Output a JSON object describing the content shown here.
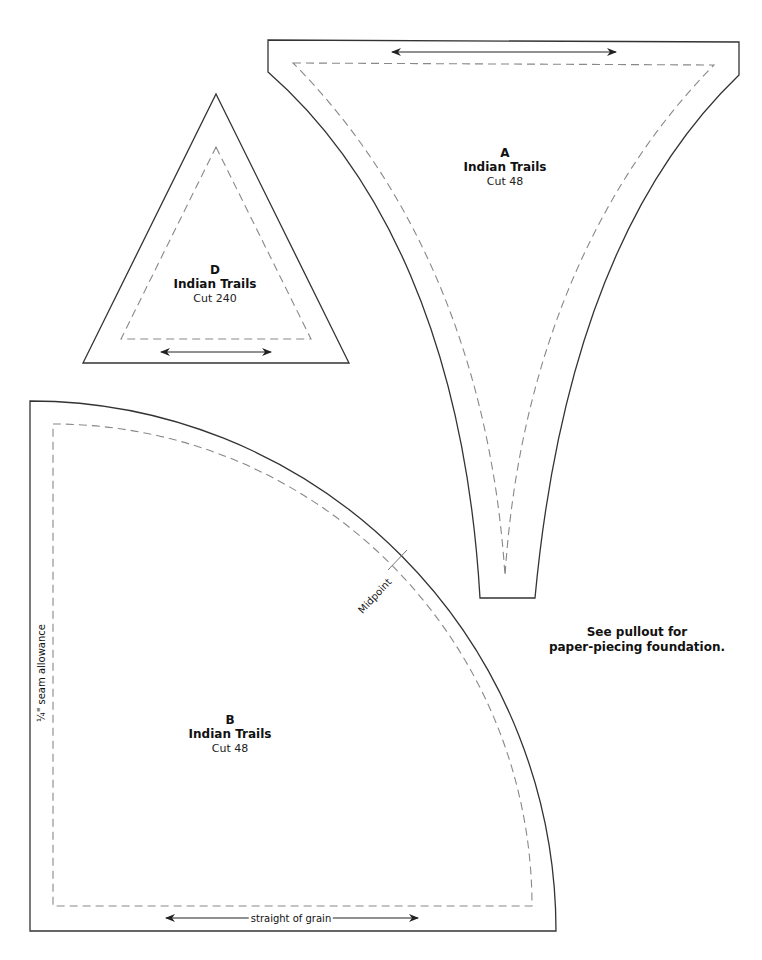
{
  "pieces": {
    "A": {
      "letter": "A",
      "name": "Indian Trails",
      "cut": "Cut 48"
    },
    "B": {
      "letter": "B",
      "name": "Indian Trails",
      "cut": "Cut 48"
    },
    "D": {
      "letter": "D",
      "name": "Indian Trails",
      "cut": "Cut 240"
    }
  },
  "annotations": {
    "seam_allowance": "¼\" seam allowance",
    "midpoint": "Midpoint",
    "grain": "straight of grain",
    "note_line1": "See pullout for",
    "note_line2": "paper-piecing foundation."
  },
  "colors": {
    "outline": "#333333",
    "seam_line": "#888888",
    "background": "#ffffff"
  }
}
